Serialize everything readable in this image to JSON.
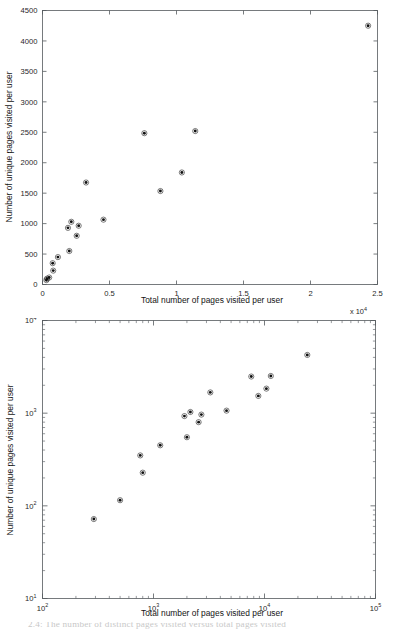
{
  "figure": {
    "background": "#ffffff",
    "marker_color": "#101010",
    "axis_color": "#555a5e",
    "partial_caption": "2.4: The number of distinct pages visited versus total pages visited"
  },
  "chart_data": [
    {
      "id": "linear-scatter",
      "type": "scatter",
      "title": "",
      "xlabel": "Total number of pages visited per user",
      "ylabel": "Number of unique pages visited per user",
      "x_multiplier_label": "x 10",
      "x_multiplier_exponent": "4",
      "xscale": "linear",
      "yscale": "linear",
      "xlim": [
        0,
        25000
      ],
      "ylim": [
        0,
        4500
      ],
      "grid": false,
      "legend": "none",
      "xticks": [
        0,
        5000,
        10000,
        15000,
        20000,
        25000
      ],
      "xticklabels": [
        "0",
        "0.5",
        "1",
        "1.5",
        "2",
        "2.5"
      ],
      "yticks": [
        0,
        500,
        1000,
        1500,
        2000,
        2500,
        3000,
        3500,
        4000,
        4500
      ],
      "yticklabels": [
        "0",
        "500",
        "1000",
        "1500",
        "2000",
        "2500",
        "3000",
        "3500",
        "4000",
        "4500"
      ],
      "points": [
        {
          "x": 290,
          "y": 72
        },
        {
          "x": 330,
          "y": 95
        },
        {
          "x": 500,
          "y": 115
        },
        {
          "x": 760,
          "y": 350
        },
        {
          "x": 800,
          "y": 228
        },
        {
          "x": 1150,
          "y": 450
        },
        {
          "x": 1900,
          "y": 930
        },
        {
          "x": 2000,
          "y": 550
        },
        {
          "x": 2150,
          "y": 1030
        },
        {
          "x": 2700,
          "y": 965
        },
        {
          "x": 2550,
          "y": 800
        },
        {
          "x": 3250,
          "y": 1675
        },
        {
          "x": 4550,
          "y": 1065
        },
        {
          "x": 7600,
          "y": 2485
        },
        {
          "x": 8800,
          "y": 1535
        },
        {
          "x": 10400,
          "y": 1840
        },
        {
          "x": 11400,
          "y": 2520
        },
        {
          "x": 24300,
          "y": 4250
        }
      ]
    },
    {
      "id": "loglog-scatter",
      "type": "scatter",
      "title": "",
      "xlabel": "Total number of pages visited per user",
      "ylabel": "Number of unique pages visited per user",
      "xscale": "log",
      "yscale": "log",
      "xlim": [
        100,
        100000
      ],
      "ylim": [
        10,
        10000
      ],
      "grid": false,
      "legend": "none",
      "xticklabels": [
        "10",
        "10",
        "10",
        "10"
      ],
      "xtickexponents": [
        "2",
        "3",
        "4",
        "5"
      ],
      "yticklabels": [
        "10",
        "10",
        "10",
        "10"
      ],
      "ytickexponents": [
        "1",
        "2",
        "3",
        "4"
      ],
      "points": [
        {
          "x": 290,
          "y": 72
        },
        {
          "x": 500,
          "y": 115
        },
        {
          "x": 760,
          "y": 350
        },
        {
          "x": 800,
          "y": 228
        },
        {
          "x": 1150,
          "y": 450
        },
        {
          "x": 1900,
          "y": 930
        },
        {
          "x": 2000,
          "y": 550
        },
        {
          "x": 2150,
          "y": 1030
        },
        {
          "x": 2550,
          "y": 800
        },
        {
          "x": 2700,
          "y": 965
        },
        {
          "x": 3250,
          "y": 1675
        },
        {
          "x": 4550,
          "y": 1065
        },
        {
          "x": 7600,
          "y": 2485
        },
        {
          "x": 8800,
          "y": 1535
        },
        {
          "x": 10400,
          "y": 1840
        },
        {
          "x": 11400,
          "y": 2520
        },
        {
          "x": 24300,
          "y": 4250
        }
      ]
    }
  ]
}
